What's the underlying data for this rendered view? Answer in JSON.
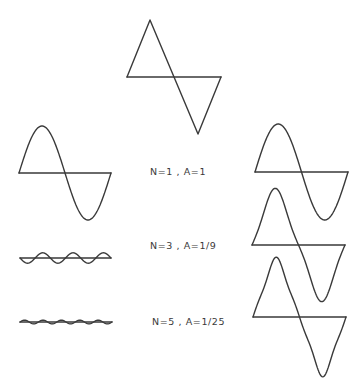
{
  "stroke_color": "#3a3a3a",
  "target_wave": {
    "name": "triangle-wave",
    "description": "Target waveform"
  },
  "harmonics": [
    {
      "label": "N=1 , A=1",
      "n": 1,
      "amplitude": "1"
    },
    {
      "label": "N=3 , A=1/9",
      "n": 3,
      "amplitude": "1/9"
    },
    {
      "label": "N=5 , A=1/25",
      "n": 5,
      "amplitude": "1/25"
    }
  ],
  "partial_sums": [
    {
      "name": "sum-n1",
      "terms": "N=1"
    },
    {
      "name": "sum-n1-n3",
      "terms": "N=1 + N=3"
    },
    {
      "name": "sum-n1-n3-n5",
      "terms": "N=1 + N=3 + N=5"
    }
  ]
}
